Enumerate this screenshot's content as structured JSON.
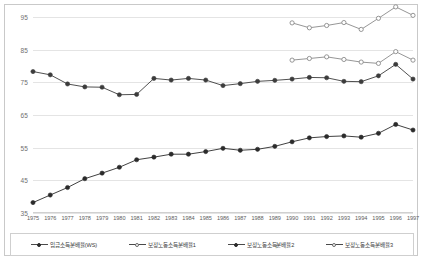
{
  "chart_data": {
    "type": "line",
    "title": "",
    "xlabel": "",
    "ylabel": "",
    "ylim": [
      35,
      95
    ],
    "yticks": [
      35,
      45,
      55,
      65,
      75,
      85,
      95
    ],
    "grid": true,
    "legend_position": "bottom",
    "categories": [
      1975,
      1976,
      1977,
      1978,
      1979,
      1980,
      1981,
      1982,
      1983,
      1984,
      1985,
      1986,
      1987,
      1988,
      1989,
      1990,
      1991,
      1992,
      1993,
      1994,
      1995,
      1996,
      1997
    ],
    "xtick_labels": [
      "1975",
      "1976",
      "1977",
      "1978",
      "1979",
      "1980",
      "1981",
      "1982",
      "1983",
      "1984",
      "1985",
      "1986",
      "1987",
      "1988",
      "1989",
      "1990",
      "1991",
      "1992",
      "1993",
      "1994",
      "1995",
      "1996",
      "1997"
    ],
    "series": [
      {
        "name": "임금소득분배율(WS)",
        "marker": "filled-circle",
        "color": "#2b2b2b",
        "values": [
          38.2,
          40.5,
          42.8,
          45.5,
          47.2,
          49.0,
          51.3,
          52.1,
          53.0,
          53.0,
          53.8,
          54.8,
          54.2,
          54.5,
          55.4,
          56.8,
          58.0,
          58.4,
          58.6,
          58.2,
          59.4,
          62.1,
          60.4
        ]
      },
      {
        "name": "보정노동소득분배율1",
        "marker": "open-circle",
        "color": "#8a8a8a",
        "values": [
          null,
          null,
          null,
          null,
          null,
          null,
          null,
          null,
          null,
          null,
          null,
          null,
          null,
          null,
          null,
          93.2,
          91.7,
          92.4,
          93.3,
          91.2,
          94.6,
          98.1,
          95.5
        ]
      },
      {
        "name": "보정노동소득분배율2",
        "marker": "filled-circle",
        "color": "#3c3c3c",
        "values": [
          78.3,
          77.3,
          74.5,
          73.6,
          73.5,
          71.2,
          71.3,
          76.2,
          75.7,
          76.2,
          75.7,
          74.0,
          74.6,
          75.3,
          75.6,
          76.0,
          76.5,
          76.4,
          75.3,
          75.2,
          77.0,
          80.5,
          76.0
        ]
      },
      {
        "name": "보정노동소득분배율3",
        "marker": "open-circle",
        "color": "#8a8a8a",
        "values": [
          null,
          null,
          null,
          null,
          null,
          null,
          null,
          null,
          null,
          null,
          null,
          null,
          null,
          null,
          null,
          81.8,
          82.3,
          82.8,
          82.0,
          81.2,
          80.8,
          84.4,
          81.8
        ]
      }
    ]
  },
  "legend": {
    "items": [
      {
        "label": "임금소득분배율(WS)",
        "marker": "filled"
      },
      {
        "label": "보정노동소득분배율1",
        "marker": "open"
      },
      {
        "label": "보정노동소득분배율2",
        "marker": "filled"
      },
      {
        "label": "보정노동소득분배율3",
        "marker": "open"
      }
    ]
  },
  "colors": {
    "grid": "#e4e4e4",
    "frame": "#c9c9c9",
    "tick_text": "#6f6f6f",
    "background": "#ffffff"
  }
}
